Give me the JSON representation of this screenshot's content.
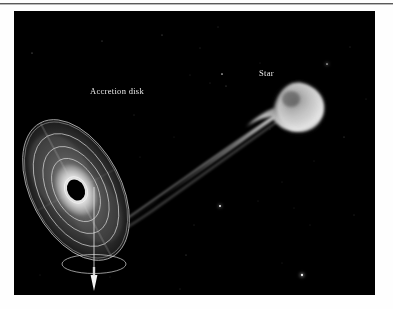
{
  "page": {
    "background_color": "#fefefe",
    "rule_color": "#5a5a5a"
  },
  "figure": {
    "background_color": "#000000",
    "left": 14,
    "top": 11,
    "width": 361,
    "height": 284,
    "labels": {
      "accretion_disk": "Accretion disk",
      "star": "Star"
    },
    "label_color": "#e9e9e9",
    "objects": [
      {
        "name": "accretion-disk",
        "label": "Accretion disk",
        "description": "tilted elliptical disk of glowing gas with concentric rings",
        "ring_count": 5,
        "center_x": 62,
        "center_y": 179,
        "tilt_degrees": -28
      },
      {
        "name": "black-hole",
        "label": "",
        "description": "dark ellipse at the centre of the accretion disk",
        "center_x": 62,
        "center_y": 179
      },
      {
        "name": "companion-star",
        "label": "Star",
        "description": "glowing teardrop-shaped star losing mass",
        "center_x": 283,
        "center_y": 94,
        "radius": 23
      },
      {
        "name": "accretion-stream",
        "label": "",
        "description": "bright stream of gas flowing from the star to the disk"
      },
      {
        "name": "rotation-axis",
        "label": "",
        "description": "vertical axis line with downward arrowhead below the disk"
      },
      {
        "name": "orbit-ring",
        "label": "",
        "description": "small ellipse around the rotation axis indicating spin"
      }
    ],
    "starfield": {
      "count": 34,
      "color": "#ffffff"
    }
  }
}
